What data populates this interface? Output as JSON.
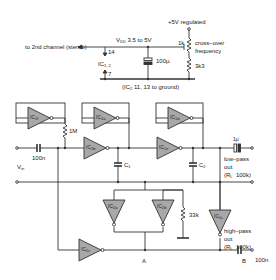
{
  "power": {
    "supply_label": "+5V regulated",
    "vdd_label": "V",
    "vdd_sub": "DD",
    "vdd_range": "3.5 to 5V",
    "to_second_channel": "to 2nd channel (stereo)",
    "pin_top": "14",
    "pin_bottom": "7",
    "ic_label": "IC",
    "ic_sub": "1, 2",
    "cap_value": "100µ",
    "pot_value": "1k",
    "pot_function_line1": "cross–over",
    "pot_function_line2": "frequency",
    "resistor_value": "3k3",
    "ground_note_prefix": "(IC",
    "ground_note_sub": "2",
    "ground_note_suffix": " 11, 13 to ground)"
  },
  "gates": [
    {
      "id": "ic1f",
      "label": "IC",
      "sub": "1f"
    },
    {
      "id": "ic1a",
      "label": "IC",
      "sub": "1a"
    },
    {
      "id": "ic1b",
      "label": "IC",
      "sub": "1b"
    },
    {
      "id": "ic1d",
      "label": "IC",
      "sub": "1d"
    },
    {
      "id": "ic1e",
      "label": "IC",
      "sub": "1e"
    },
    {
      "id": "ic2a",
      "label": "IC",
      "sub": "2a"
    },
    {
      "id": "ic2b",
      "label": "IC",
      "sub": "2b"
    },
    {
      "id": "ic1c",
      "label": "IC",
      "sub": "1c"
    },
    {
      "id": "ic2c",
      "label": "IC",
      "sub": "2c"
    }
  ],
  "components": {
    "r_feedback": "1M",
    "c_input": "100n",
    "vin_label": "V",
    "vin_sub": "in",
    "c1_label": "C",
    "c1_sub": "1",
    "c2_label": "C",
    "c2_sub": "2",
    "c_out_lp": "1µ",
    "r_33k": "33k",
    "c_out_hp": "100n"
  },
  "outputs": {
    "low_pass_line1": "low–pass",
    "low_pass_line2": "out",
    "low_pass_load": "(R",
    "low_pass_load_sub": "L",
    "low_pass_load_val": "100k)",
    "high_pass_line1": "high–pass",
    "high_pass_line2": "out",
    "high_pass_load": "(R",
    "high_pass_load_sub": "L",
    "high_pass_load_val": "100k)"
  },
  "nodes": {
    "node_a": "A",
    "node_b": "B"
  },
  "colors": {
    "wire": "#333333",
    "gate_fill": "#a8a8a8",
    "gate_stroke": "#333333",
    "text": "#222222"
  }
}
